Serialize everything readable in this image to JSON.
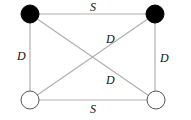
{
  "diagram": {
    "nodes": [
      {
        "id": "top-left",
        "fill": "black"
      },
      {
        "id": "top-right",
        "fill": "black"
      },
      {
        "id": "bottom-left",
        "fill": "white"
      },
      {
        "id": "bottom-right",
        "fill": "white"
      }
    ],
    "edges": [
      {
        "from": "top-left",
        "to": "top-right",
        "label": "S"
      },
      {
        "from": "bottom-left",
        "to": "bottom-right",
        "label": "S"
      },
      {
        "from": "top-left",
        "to": "bottom-left",
        "label": "D"
      },
      {
        "from": "top-right",
        "to": "bottom-right",
        "label": "D"
      },
      {
        "from": "top-right",
        "to": "bottom-left",
        "label": "D"
      },
      {
        "from": "top-left",
        "to": "bottom-right",
        "label": "D"
      }
    ]
  }
}
